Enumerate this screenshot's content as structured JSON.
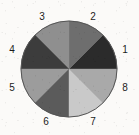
{
  "figure": {
    "kind": "pie-chart-diagram",
    "background_color": "#fbfaf8",
    "outline_color": "#555555",
    "label_color": "#1c1c1c"
  },
  "chart_data": {
    "type": "pie",
    "title": "",
    "subtitle": "",
    "xlabel": "",
    "ylabel": "",
    "legend_position": "none",
    "grid": false,
    "labels_outside": true,
    "start_angle_deg": 0,
    "direction": "counterclockwise",
    "total_slices": 8,
    "categories": [
      "1",
      "2",
      "3",
      "4",
      "5",
      "6",
      "7",
      "8"
    ],
    "values": [
      12.5,
      12.5,
      12.5,
      12.5,
      12.5,
      12.5,
      12.5,
      12.5
    ],
    "slice_angles_deg": [
      45,
      45,
      45,
      45,
      45,
      45,
      45,
      45
    ],
    "colors": [
      "#2b2b2b",
      "#6e6e6e",
      "#8f8f8f",
      "#3c3c3c",
      "#9c9c9c",
      "#5b5b5b",
      "#c9c9c9",
      "#a9a9a9"
    ],
    "slices": [
      {
        "label": "1",
        "value": 12.5,
        "color": "#2b2b2b",
        "angle_start_deg": 0,
        "angle_end_deg": 45,
        "label_x": 125,
        "label_y": 50
      },
      {
        "label": "2",
        "value": 12.5,
        "color": "#6e6e6e",
        "angle_start_deg": 45,
        "angle_end_deg": 90,
        "label_x": 93,
        "label_y": 17
      },
      {
        "label": "3",
        "value": 12.5,
        "color": "#8f8f8f",
        "angle_start_deg": 90,
        "angle_end_deg": 135,
        "label_x": 42,
        "label_y": 17
      },
      {
        "label": "4",
        "value": 12.5,
        "color": "#3c3c3c",
        "angle_start_deg": 135,
        "angle_end_deg": 180,
        "label_x": 12,
        "label_y": 50
      },
      {
        "label": "5",
        "value": 12.5,
        "color": "#9c9c9c",
        "angle_start_deg": 180,
        "angle_end_deg": 225,
        "label_x": 12,
        "label_y": 88
      },
      {
        "label": "6",
        "value": 12.5,
        "color": "#5b5b5b",
        "angle_start_deg": 225,
        "angle_end_deg": 270,
        "label_x": 46,
        "label_y": 122
      },
      {
        "label": "7",
        "value": 12.5,
        "color": "#c9c9c9",
        "angle_start_deg": 270,
        "angle_end_deg": 315,
        "label_x": 93,
        "label_y": 122
      },
      {
        "label": "8",
        "value": 12.5,
        "color": "#a9a9a9",
        "angle_start_deg": 315,
        "angle_end_deg": 360,
        "label_x": 125,
        "label_y": 88
      }
    ],
    "geometry": {
      "center_x": 69,
      "center_y": 69,
      "radius": 48
    }
  }
}
